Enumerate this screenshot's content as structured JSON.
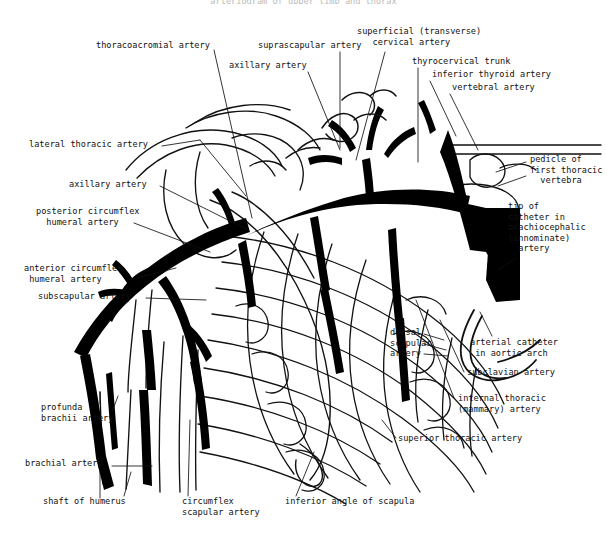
{
  "figure": {
    "title_fragment": "arteriogram of upper limb and thorax",
    "ink_color": "#000000",
    "background_color": "#ffffff",
    "line_color": "#111111"
  },
  "labels": [
    {
      "id": "thoracoacromial-artery",
      "text": "thoracoacromial artery",
      "x": 96,
      "y": 44,
      "align": "left"
    },
    {
      "id": "suprascapular-artery",
      "text": "suprascapular artery",
      "x": 258,
      "y": 44,
      "align": "left"
    },
    {
      "id": "axillary-artery-top",
      "text": "axillary artery",
      "x": 229,
      "y": 64,
      "align": "left"
    },
    {
      "id": "superficial-cervical-artery",
      "text": "superficial (transverse)\n   cervical artery",
      "x": 357,
      "y": 30,
      "align": "left"
    },
    {
      "id": "thyrocervical-trunk",
      "text": "thyrocervical trunk",
      "x": 412,
      "y": 60,
      "align": "left"
    },
    {
      "id": "inferior-thyroid-artery",
      "text": "inferior thyroid artery",
      "x": 432,
      "y": 73,
      "align": "left"
    },
    {
      "id": "vertebral-artery",
      "text": "vertebral artery",
      "x": 452,
      "y": 86,
      "align": "left"
    },
    {
      "id": "lateral-thoracic-artery",
      "text": "lateral thoracic artery",
      "x": 29,
      "y": 143,
      "align": "left"
    },
    {
      "id": "axillary-artery-left",
      "text": "axillary artery",
      "x": 69,
      "y": 183,
      "align": "left"
    },
    {
      "id": "posterior-circumflex-humeral",
      "text": "posterior circumflex\n  humeral artery",
      "x": 36,
      "y": 210,
      "align": "left"
    },
    {
      "id": "anterior-circumflex-humeral",
      "text": "anterior circumflex\n humeral artery",
      "x": 24,
      "y": 267,
      "align": "left"
    },
    {
      "id": "subscapular-artery",
      "text": "subscapular artery",
      "x": 38,
      "y": 295,
      "align": "left"
    },
    {
      "id": "pedicle-first-thoracic-vertebra",
      "text": "pedicle of\nfirst thoracic\n  vertebra",
      "x": 530,
      "y": 158,
      "align": "left"
    },
    {
      "id": "tip-of-catheter",
      "text": "tip of\ncatheter in\nbrachiocephalic\n(innominate)\n  artery",
      "x": 508,
      "y": 205,
      "align": "left"
    },
    {
      "id": "dorsal-scapular-artery",
      "text": "dorsal\nscapular\nartery",
      "x": 390,
      "y": 331,
      "align": "left"
    },
    {
      "id": "arterial-catheter-aortic-arch",
      "text": "arterial catheter\n in aortic arch",
      "x": 470,
      "y": 341,
      "align": "left"
    },
    {
      "id": "subclavian-artery",
      "text": "subclavian artery",
      "x": 467,
      "y": 371,
      "align": "left"
    },
    {
      "id": "internal-thoracic-artery",
      "text": "internal thoracic\n(mammary) artery",
      "x": 458,
      "y": 397,
      "align": "left"
    },
    {
      "id": "superior-thoracic-artery",
      "text": "superior thoracic artery",
      "x": 398,
      "y": 437,
      "align": "left"
    },
    {
      "id": "profunda-brachii-artery",
      "text": "profunda\nbrachii artery",
      "x": 41,
      "y": 406,
      "align": "left"
    },
    {
      "id": "brachial-artery",
      "text": "brachial artery",
      "x": 25,
      "y": 462,
      "align": "left"
    },
    {
      "id": "shaft-of-humerus",
      "text": "shaft of humerus",
      "x": 43,
      "y": 500,
      "align": "left"
    },
    {
      "id": "circumflex-scapular-artery",
      "text": "circumflex\nscapular artery",
      "x": 182,
      "y": 500,
      "align": "left"
    },
    {
      "id": "inferior-angle-of-scapula",
      "text": "inferior angle of scapula",
      "x": 285,
      "y": 500,
      "align": "left"
    }
  ],
  "structures": {
    "arteries": [
      "vertebral artery",
      "inferior thyroid artery",
      "thyrocervical trunk",
      "superficial (transverse) cervical artery",
      "suprascapular artery",
      "subclavian artery",
      "brachiocephalic (innominate) artery",
      "axillary artery",
      "thoracoacromial artery",
      "lateral thoracic artery",
      "superior thoracic artery",
      "internal thoracic (mammary) artery",
      "subscapular artery",
      "circumflex scapular artery",
      "dorsal scapular artery",
      "anterior circumflex humeral artery",
      "posterior circumflex humeral artery",
      "brachial artery",
      "profunda brachii artery"
    ],
    "bones": [
      "shaft of humerus",
      "pedicle of first thoracic vertebra",
      "inferior angle of scapula",
      "ribs"
    ],
    "devices": [
      "arterial catheter in aortic arch",
      "tip of catheter in brachiocephalic (innominate) artery"
    ]
  }
}
